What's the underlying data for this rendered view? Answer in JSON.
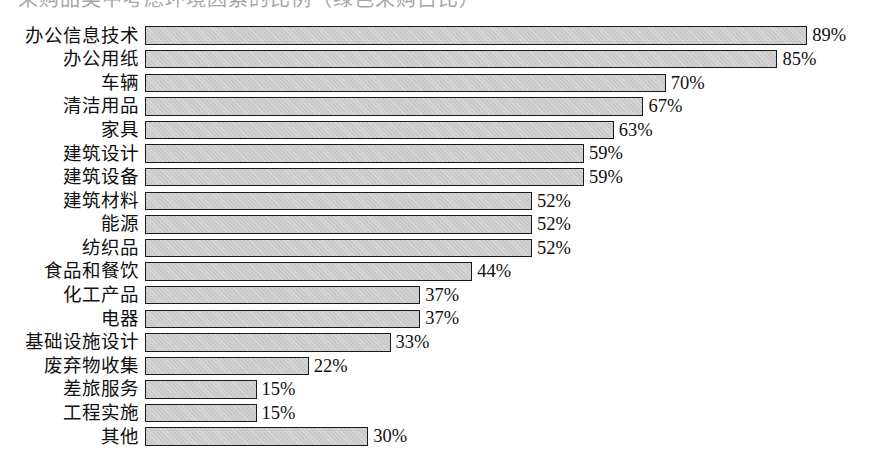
{
  "figure": {
    "background_color": "#ffffff",
    "bar_fill_color": "#c9c9c9",
    "bar_border_color": "#1a1a1a",
    "text_color": "#101010",
    "top_cropped_text": "采购品类中考虑环境因素的比例（绿色采购占比）"
  },
  "chart_data": {
    "type": "bar",
    "orientation": "horizontal",
    "title": "",
    "subtitle": "",
    "xlabel": "",
    "ylabel": "",
    "xlim": [
      0,
      100
    ],
    "grid": false,
    "legend": "none",
    "value_suffix": "%",
    "categories": [
      "办公信息技术",
      "办公用纸",
      "车辆",
      "清洁用品",
      "家具",
      "建筑设计",
      "建筑设备",
      "建筑材料",
      "能源",
      "纺织品",
      "食品和餐饮",
      "化工产品",
      "电器",
      "基础设施设计",
      "废弃物收集",
      "差旅服务",
      "工程实施",
      "其他"
    ],
    "values": [
      89,
      85,
      70,
      67,
      63,
      59,
      59,
      52,
      52,
      52,
      44,
      37,
      37,
      33,
      22,
      15,
      15,
      30
    ],
    "value_labels": [
      "89%",
      "85%",
      "70%",
      "67%",
      "63%",
      "59%",
      "59%",
      "52%",
      "52%",
      "52%",
      "44%",
      "37%",
      "37%",
      "33%",
      "22%",
      "15%",
      "15%",
      "30%"
    ],
    "bars": [
      {
        "label": "办公信息技术",
        "value": 89,
        "value_label": "89%"
      },
      {
        "label": "办公用纸",
        "value": 85,
        "value_label": "85%"
      },
      {
        "label": "车辆",
        "value": 70,
        "value_label": "70%"
      },
      {
        "label": "清洁用品",
        "value": 67,
        "value_label": "67%"
      },
      {
        "label": "家具",
        "value": 63,
        "value_label": "63%"
      },
      {
        "label": "建筑设计",
        "value": 59,
        "value_label": "59%"
      },
      {
        "label": "建筑设备",
        "value": 59,
        "value_label": "59%"
      },
      {
        "label": "建筑材料",
        "value": 52,
        "value_label": "52%"
      },
      {
        "label": "能源",
        "value": 52,
        "value_label": "52%"
      },
      {
        "label": "纺织品",
        "value": 52,
        "value_label": "52%"
      },
      {
        "label": "食品和餐饮",
        "value": 44,
        "value_label": "44%"
      },
      {
        "label": "化工产品",
        "value": 37,
        "value_label": "37%"
      },
      {
        "label": "电器",
        "value": 37,
        "value_label": "37%"
      },
      {
        "label": "基础设施设计",
        "value": 33,
        "value_label": "33%"
      },
      {
        "label": "废弃物收集",
        "value": 22,
        "value_label": "22%"
      },
      {
        "label": "差旅服务",
        "value": 15,
        "value_label": "15%"
      },
      {
        "label": "工程实施",
        "value": 15,
        "value_label": "15%"
      },
      {
        "label": "其他",
        "value": 30,
        "value_label": "30%"
      }
    ]
  }
}
